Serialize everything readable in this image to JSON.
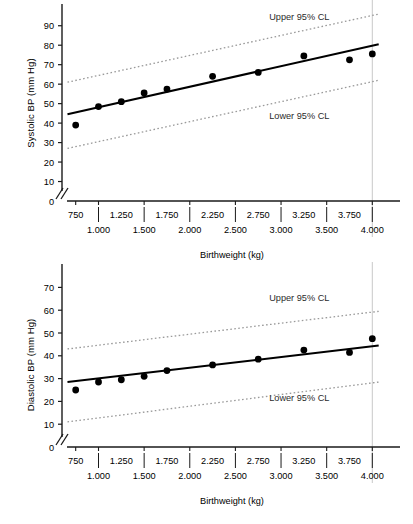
{
  "figure": {
    "xaxis_title": "Birthweight (kg)",
    "xtick_upper": [
      "750",
      "1.250",
      "1.750",
      "2.250",
      "2.750",
      "3.250",
      "3.750"
    ],
    "xtick_lower": [
      "1.000",
      "1.500",
      "2.000",
      "2.500",
      "3.000",
      "3.500",
      "4.000"
    ],
    "upper_cl_label": "Upper 95% CL",
    "lower_cl_label": "Lower 95% CL",
    "colors": {
      "line": "#000000",
      "points": "#000000",
      "cl_band": "#9a9a9a",
      "axis": "#1a1a1a",
      "gridline": "#c8c8c8"
    }
  },
  "chart_data": [
    {
      "type": "scatter",
      "title": "",
      "xlabel": "Birthweight (kg)",
      "ylabel": "Systolic BP (mm Hg)",
      "xlim": [
        0.6,
        4.15
      ],
      "ylim": [
        0,
        95
      ],
      "yticks": [
        0,
        10,
        20,
        30,
        40,
        50,
        60,
        70,
        80,
        90
      ],
      "ytick_labels": [
        "0",
        "10",
        "20",
        "30",
        "40",
        "50",
        "60",
        "70",
        "80",
        "90"
      ],
      "axis_break": true,
      "grid": false,
      "legend_position": "inline-annotation",
      "x": [
        0.75,
        1.0,
        1.25,
        1.5,
        1.75,
        2.25,
        2.75,
        3.25,
        3.75,
        4.0
      ],
      "values": [
        39,
        48.5,
        51,
        55.5,
        57.5,
        64,
        66,
        74.5,
        72.5,
        75.5
      ],
      "series": [
        {
          "name": "Observed mean systolic BP",
          "type": "scatter",
          "x": [
            0.75,
            1.0,
            1.25,
            1.5,
            1.75,
            2.25,
            2.75,
            3.25,
            3.75,
            4.0
          ],
          "values": [
            39,
            48.5,
            51,
            55.5,
            57.5,
            64,
            66,
            74.5,
            72.5,
            75.5
          ]
        },
        {
          "name": "Regression line",
          "type": "line",
          "x": [
            0.66,
            4.07
          ],
          "values": [
            44.5,
            80.5
          ]
        },
        {
          "name": "Upper 95% CL",
          "type": "line",
          "style": "dotted",
          "x": [
            0.66,
            4.07
          ],
          "values": [
            61,
            96
          ]
        },
        {
          "name": "Lower 95% CL",
          "type": "line",
          "style": "dotted",
          "x": [
            0.66,
            4.07
          ],
          "values": [
            27,
            62
          ]
        }
      ],
      "annotations": [
        {
          "text": "Upper 95% CL",
          "x": 3.2,
          "y": 93
        },
        {
          "text": "Lower 95% CL",
          "x": 3.2,
          "y": 42
        }
      ]
    },
    {
      "type": "scatter",
      "title": "",
      "xlabel": "Birthweight (kg)",
      "ylabel": "Diastolic BP (mm Hg)",
      "xlim": [
        0.6,
        4.15
      ],
      "ylim": [
        0,
        75
      ],
      "yticks": [
        0,
        10,
        20,
        30,
        40,
        50,
        60,
        70
      ],
      "ytick_labels": [
        "0",
        "10",
        "20",
        "30",
        "40",
        "50",
        "60",
        "70"
      ],
      "axis_break": true,
      "grid": false,
      "legend_position": "inline-annotation",
      "x": [
        0.75,
        1.0,
        1.25,
        1.5,
        1.75,
        2.25,
        2.75,
        3.25,
        3.75,
        4.0
      ],
      "values": [
        25,
        28.5,
        29.5,
        31,
        33.5,
        36,
        38.5,
        42.5,
        41.5,
        47.5
      ],
      "series": [
        {
          "name": "Observed mean diastolic BP",
          "type": "scatter",
          "x": [
            0.75,
            1.0,
            1.25,
            1.5,
            1.75,
            2.25,
            2.75,
            3.25,
            3.75,
            4.0
          ],
          "values": [
            25,
            28.5,
            29.5,
            31,
            33.5,
            36,
            38.5,
            42.5,
            41.5,
            47.5
          ]
        },
        {
          "name": "Regression line",
          "type": "line",
          "x": [
            0.66,
            4.07
          ],
          "values": [
            28.5,
            44.5
          ]
        },
        {
          "name": "Upper 95% CL",
          "type": "line",
          "style": "dotted",
          "x": [
            0.66,
            4.07
          ],
          "values": [
            43,
            59.5
          ]
        },
        {
          "name": "Lower 95% CL",
          "type": "line",
          "style": "dotted",
          "x": [
            0.66,
            4.07
          ],
          "values": [
            11,
            28.5
          ]
        }
      ],
      "annotations": [
        {
          "text": "Upper 95% CL",
          "x": 3.2,
          "y": 64
        },
        {
          "text": "Lower 95% CL",
          "x": 3.2,
          "y": 20
        }
      ]
    }
  ]
}
